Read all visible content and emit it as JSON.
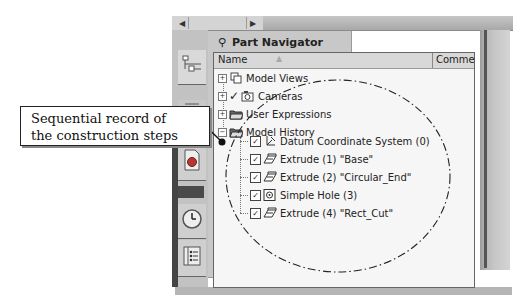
{
  "window": {
    "scroll_left_icon": "arrow-left",
    "scroll_right_icon": "arrow-right"
  },
  "sidebar": {
    "tabs": [
      {
        "name": "assembly-navigator-tab",
        "icon": "tree-structure-icon"
      },
      {
        "name": "constraint-navigator-tab",
        "icon": "constraint-icon"
      },
      {
        "name": "part-navigator-tab",
        "icon": "part-icon"
      },
      {
        "name": "history-tab",
        "icon": "clock-icon"
      },
      {
        "name": "reuse-library-tab",
        "icon": "list-book-icon"
      }
    ]
  },
  "panel": {
    "title": "Part Navigator",
    "title_icon": "navigator-icon",
    "columns": {
      "name": "Name",
      "comment": "Comme"
    },
    "tree": [
      {
        "label": "Model Views",
        "expander": "+",
        "icon": "model-views-icon",
        "level": 0
      },
      {
        "label": "Cameras",
        "expander": "+",
        "icon": "camera-icon",
        "check": "✓",
        "level": 0
      },
      {
        "label": "User Expressions",
        "expander": "+",
        "icon": "folder-icon",
        "level": 0
      },
      {
        "label": "Model History",
        "expander": "−",
        "icon": "folder-open-icon",
        "level": 0
      },
      {
        "label": "Datum Coordinate System (0)",
        "icon": "datum-csys-icon",
        "checked": true,
        "level": 1
      },
      {
        "label": "Extrude (1) \"Base\"",
        "icon": "extrude-icon",
        "checked": true,
        "level": 1
      },
      {
        "label": "Extrude (2) \"Circular_End\"",
        "icon": "extrude-icon",
        "checked": true,
        "level": 1
      },
      {
        "label": "Simple Hole (3)",
        "icon": "hole-icon",
        "checked": true,
        "level": 1
      },
      {
        "label": "Extrude (4) \"Rect_Cut\"",
        "icon": "extrude-icon",
        "checked": true,
        "level": 1
      }
    ]
  },
  "annotation": {
    "callout_line1": "Sequential record of",
    "callout_line2": "the construction steps"
  }
}
